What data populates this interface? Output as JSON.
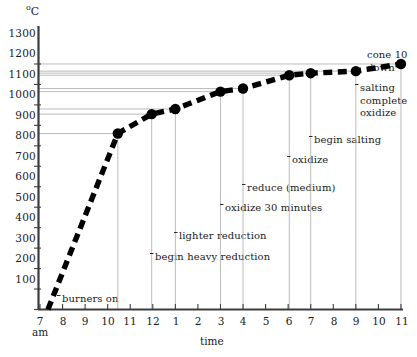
{
  "chart_data": {
    "type": "line",
    "title": "",
    "xlabel": "time",
    "ylabel": "",
    "yunit": "°C",
    "ylim": [
      100,
      1300
    ],
    "yticks": [
      1300,
      1200,
      1100,
      1000,
      900,
      800,
      700,
      600,
      500,
      400,
      300,
      200,
      100
    ],
    "xticks": [
      "7",
      "8",
      "9",
      "10",
      "11",
      "12",
      "1",
      "2",
      "3",
      "4",
      "5",
      "6",
      "7",
      "8",
      "9",
      "10",
      "11"
    ],
    "xtick_sublabel": "am",
    "grid": "horizontal-partial",
    "legend": "none",
    "marker": "filled-circle",
    "linestyle": "thick-dashed",
    "series": [
      {
        "name": "kiln temperature",
        "points": [
          {
            "time": "7:20",
            "hour": 7.35,
            "value": 100
          },
          {
            "time": "10:30",
            "hour": 10.45,
            "value": 960
          },
          {
            "time": "12:00",
            "hour": 11.95,
            "value": 1055
          },
          {
            "time": "1:00",
            "hour": 13.0,
            "value": 1080
          },
          {
            "time": "3:00",
            "hour": 15.0,
            "value": 1165
          },
          {
            "time": "3:30",
            "hour": 16.0,
            "value": 1180
          },
          {
            "time": "6:00",
            "hour": 18.05,
            "value": 1245
          },
          {
            "time": "7:00",
            "hour": 19.0,
            "value": 1255
          },
          {
            "time": "9:00",
            "hour": 21.0,
            "value": 1265
          },
          {
            "time": "11:00",
            "hour": 23.0,
            "value": 1300
          }
        ]
      }
    ],
    "annotations": [
      {
        "id": "burners-on",
        "text": [
          "burners on"
        ],
        "x": 62,
        "y": 299,
        "leader": true
      },
      {
        "id": "begin-heavy",
        "text": [
          "begin heavy reduction"
        ],
        "x": 155,
        "y": 257,
        "leader": true
      },
      {
        "id": "lighter-reduction",
        "text": [
          "lighter reduction"
        ],
        "x": 179,
        "y": 236,
        "leader": true
      },
      {
        "id": "oxidize-30",
        "text": [
          "oxidize 30 minutes"
        ],
        "x": 225,
        "y": 208,
        "leader": true
      },
      {
        "id": "reduce-medium",
        "text": [
          "reduce (medium)"
        ],
        "x": 247,
        "y": 188,
        "leader": true
      },
      {
        "id": "oxidize",
        "text": [
          "oxidize"
        ],
        "x": 292,
        "y": 160,
        "leader": true
      },
      {
        "id": "begin-salting",
        "text": [
          "begin salting"
        ],
        "x": 314,
        "y": 140,
        "leader": true
      },
      {
        "id": "salting-complete",
        "text": [
          "salting",
          "complete",
          "oxidize"
        ],
        "x": 360,
        "y": 88,
        "leader": true
      },
      {
        "id": "cone-10-down",
        "text": [
          "cone 10",
          "down"
        ],
        "x": 367,
        "y": 55,
        "leader": false
      }
    ]
  },
  "axis": {
    "y_label_unit": "°C",
    "x_label": "time",
    "am_marker": "am"
  },
  "colors": {
    "line": "#000000",
    "grid": "#b4b4b4",
    "axis": "#3c3c3c",
    "text": "#1a1a1a"
  }
}
